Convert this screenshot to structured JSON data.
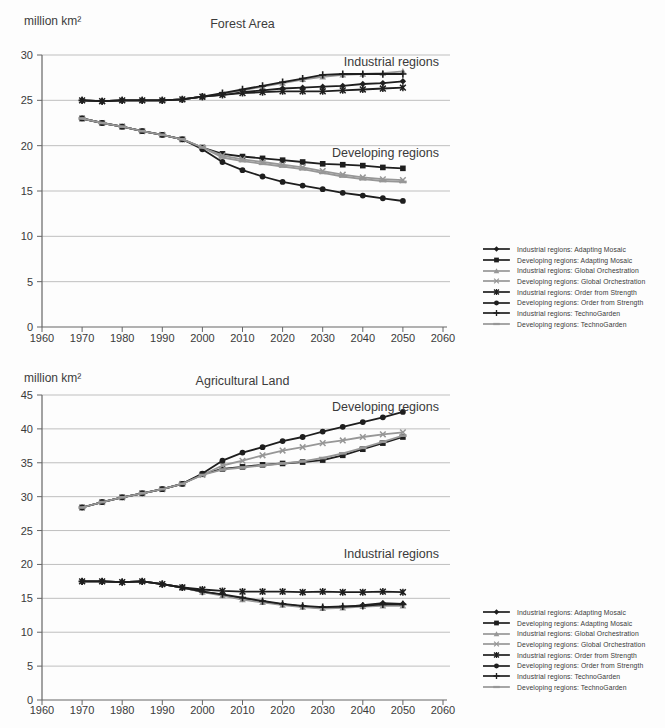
{
  "styles": {
    "series_black": "#1e1e1e",
    "series_gray": "#979797",
    "grid_color": "#b8b8b8",
    "axis_color": "#666666",
    "text_color": "#3a3a3a",
    "background": "#fdfdfd"
  },
  "chart_data": [
    {
      "type": "line",
      "title": "Forest Area",
      "unit_label": "million km²",
      "xlim": [
        1960,
        2060
      ],
      "ylim": [
        0,
        30
      ],
      "yticks": [
        0,
        5,
        10,
        15,
        20,
        25,
        30
      ],
      "xticks": [
        1960,
        1970,
        1980,
        1990,
        2000,
        2010,
        2020,
        2030,
        2040,
        2050,
        2060
      ],
      "grid": "horizontal",
      "legend_position": "right",
      "annotations": [
        {
          "text": "Industrial regions",
          "x": 2059,
          "y": 29.3
        },
        {
          "text": "Developing regions",
          "x": 2059,
          "y": 19.2
        }
      ],
      "x": [
        1970,
        1975,
        1980,
        1985,
        1990,
        1995,
        2000,
        2005,
        2010,
        2015,
        2020,
        2025,
        2030,
        2035,
        2040,
        2045,
        2050
      ],
      "series": [
        {
          "name": "Industrial regions: Adapting Mosaic",
          "marker": "diamond",
          "color": "black",
          "values": [
            25.0,
            24.9,
            25.0,
            25.0,
            25.0,
            25.1,
            25.4,
            25.6,
            25.9,
            26.1,
            26.3,
            26.4,
            26.5,
            26.6,
            26.8,
            26.9,
            27.1
          ]
        },
        {
          "name": "Developing regions: Adapting Mosaic",
          "marker": "square",
          "color": "black",
          "values": [
            23.0,
            22.5,
            22.1,
            21.6,
            21.2,
            20.7,
            19.8,
            19.1,
            18.8,
            18.6,
            18.4,
            18.2,
            18.0,
            17.9,
            17.8,
            17.6,
            17.5
          ]
        },
        {
          "name": "Industrial regions: Global Orchestration",
          "marker": "triangle",
          "color": "gray",
          "values": [
            25.0,
            24.9,
            25.0,
            25.0,
            25.0,
            25.1,
            25.4,
            25.7,
            26.1,
            26.5,
            26.9,
            27.3,
            27.6,
            27.8,
            27.9,
            28.0,
            28.2
          ]
        },
        {
          "name": "Developing regions: Global Orchestration",
          "marker": "x",
          "color": "gray",
          "values": [
            23.0,
            22.5,
            22.1,
            21.6,
            21.2,
            20.7,
            19.8,
            18.9,
            18.5,
            18.2,
            17.9,
            17.6,
            17.2,
            16.8,
            16.5,
            16.3,
            16.2
          ]
        },
        {
          "name": "Industrial regions: Order from Strength",
          "marker": "star",
          "color": "black",
          "values": [
            25.0,
            24.9,
            25.0,
            25.0,
            25.0,
            25.1,
            25.4,
            25.6,
            25.8,
            25.9,
            26.0,
            26.0,
            26.0,
            26.1,
            26.2,
            26.3,
            26.4
          ]
        },
        {
          "name": "Developing regions: Order from Strength",
          "marker": "circle",
          "color": "black",
          "values": [
            23.0,
            22.5,
            22.1,
            21.6,
            21.2,
            20.7,
            19.6,
            18.2,
            17.3,
            16.6,
            16.0,
            15.6,
            15.2,
            14.8,
            14.5,
            14.2,
            13.9
          ]
        },
        {
          "name": "Industrial regions: TechnoGarden",
          "marker": "plus",
          "color": "black",
          "values": [
            25.0,
            24.9,
            25.0,
            25.0,
            25.0,
            25.1,
            25.4,
            25.8,
            26.2,
            26.6,
            27.0,
            27.4,
            27.8,
            27.9,
            27.9,
            27.9,
            27.9
          ]
        },
        {
          "name": "Developing regions: TechnoGarden",
          "marker": "dash",
          "color": "gray",
          "values": [
            23.0,
            22.5,
            22.1,
            21.6,
            21.2,
            20.7,
            19.8,
            18.7,
            18.3,
            18.0,
            17.7,
            17.4,
            17.0,
            16.6,
            16.3,
            16.1,
            16.0
          ]
        }
      ]
    },
    {
      "type": "line",
      "title": "Agricultural Land",
      "unit_label": "million km²",
      "xlim": [
        1960,
        2060
      ],
      "ylim": [
        0,
        45
      ],
      "yticks": [
        0,
        5,
        10,
        15,
        20,
        25,
        30,
        35,
        40,
        45
      ],
      "xticks": [
        1960,
        1970,
        1980,
        1990,
        2000,
        2010,
        2020,
        2030,
        2040,
        2050,
        2060
      ],
      "grid": "horizontal",
      "legend_position": "right",
      "annotations": [
        {
          "text": "Developing regions",
          "x": 2059,
          "y": 43.3
        },
        {
          "text": "Industrial regions",
          "x": 2059,
          "y": 21.6
        }
      ],
      "x": [
        1970,
        1975,
        1980,
        1985,
        1990,
        1995,
        2000,
        2005,
        2010,
        2015,
        2020,
        2025,
        2030,
        2035,
        2040,
        2045,
        2050
      ],
      "series": [
        {
          "name": "Industrial regions: Adapting Mosaic",
          "marker": "diamond",
          "color": "black",
          "values": [
            17.5,
            17.5,
            17.4,
            17.5,
            17.1,
            16.6,
            16.0,
            15.5,
            14.9,
            14.5,
            14.1,
            13.8,
            13.6,
            13.7,
            14.0,
            14.3,
            14.2
          ]
        },
        {
          "name": "Developing regions: Adapting Mosaic",
          "marker": "square",
          "color": "black",
          "values": [
            28.4,
            29.2,
            29.9,
            30.5,
            31.1,
            31.9,
            33.3,
            34.1,
            34.4,
            34.7,
            34.9,
            35.1,
            35.4,
            36.1,
            37.0,
            37.9,
            38.8
          ]
        },
        {
          "name": "Industrial regions: Global Orchestration",
          "marker": "triangle",
          "color": "gray",
          "values": [
            17.5,
            17.5,
            17.4,
            17.5,
            17.1,
            16.6,
            15.9,
            15.4,
            14.8,
            14.4,
            14.0,
            13.7,
            13.5,
            13.6,
            13.8,
            13.9,
            13.9
          ]
        },
        {
          "name": "Developing regions: Global Orchestration",
          "marker": "x",
          "color": "gray",
          "values": [
            28.4,
            29.2,
            29.9,
            30.5,
            31.1,
            31.9,
            33.2,
            34.6,
            35.3,
            36.1,
            36.8,
            37.3,
            37.9,
            38.3,
            38.8,
            39.2,
            39.5
          ]
        },
        {
          "name": "Industrial regions: Order from Strength",
          "marker": "star",
          "color": "black",
          "values": [
            17.5,
            17.5,
            17.4,
            17.5,
            17.1,
            16.6,
            16.3,
            16.1,
            16.0,
            16.0,
            16.0,
            15.9,
            16.0,
            15.9,
            15.9,
            16.0,
            15.9
          ]
        },
        {
          "name": "Developing regions: Order from Strength",
          "marker": "circle",
          "color": "black",
          "values": [
            28.4,
            29.2,
            29.9,
            30.5,
            31.1,
            31.9,
            33.4,
            35.3,
            36.5,
            37.3,
            38.2,
            38.8,
            39.6,
            40.3,
            41.0,
            41.7,
            42.5
          ]
        },
        {
          "name": "Industrial regions: TechnoGarden",
          "marker": "plus",
          "color": "black",
          "values": [
            17.5,
            17.5,
            17.4,
            17.5,
            17.1,
            16.6,
            16.0,
            15.6,
            15.1,
            14.6,
            14.2,
            13.9,
            13.7,
            13.8,
            13.9,
            14.1,
            14.1
          ]
        },
        {
          "name": "Developing regions: TechnoGarden",
          "marker": "dash",
          "color": "gray",
          "values": [
            28.4,
            29.2,
            29.9,
            30.5,
            31.1,
            31.9,
            33.2,
            34.0,
            34.3,
            34.6,
            34.9,
            35.2,
            35.7,
            36.4,
            37.2,
            38.1,
            39.0
          ]
        }
      ]
    }
  ]
}
